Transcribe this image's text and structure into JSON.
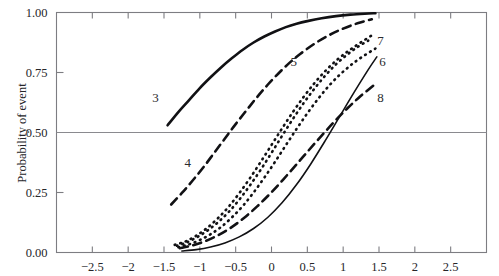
{
  "figure": {
    "background_color": "#ffffff",
    "ink_color": "#111114",
    "axis_color": "#7d7d82"
  },
  "chart_data": {
    "type": "line",
    "title": "",
    "xlabel": "",
    "ylabel": "Probability of event",
    "xlim": [
      -3.0,
      3.0
    ],
    "ylim": [
      0.0,
      1.0
    ],
    "grid": false,
    "reference_line_y": 0.5,
    "legend_position": "inline-curve-labels",
    "xticks": [
      -2.5,
      -2,
      -1.5,
      -1,
      -0.5,
      0,
      0.5,
      1,
      1.5,
      2,
      2.5
    ],
    "xtick_labels": [
      "−2.5",
      "−2",
      "−1.5",
      "−1",
      "−0.5",
      "0",
      "0.5",
      "1",
      "1.5",
      "2",
      "2.5"
    ],
    "yticks": [
      0.0,
      0.25,
      0.5,
      0.75,
      1.0
    ],
    "ytick_labels": [
      "0.00",
      "0.25",
      "0.50",
      "0.75",
      "1.00"
    ],
    "series": [
      {
        "name": "3",
        "label": "3",
        "style": "solid",
        "linewidth": 2.6,
        "label_x": -1.62,
        "label_y": 0.645,
        "x": [
          -1.45,
          -1.3,
          -1.15,
          -1.0,
          -0.85,
          -0.7,
          -0.55,
          -0.4,
          -0.25,
          -0.1,
          0.05,
          0.2,
          0.35,
          0.5,
          0.7,
          0.9,
          1.1,
          1.3,
          1.45
        ],
        "y": [
          0.53,
          0.585,
          0.635,
          0.685,
          0.73,
          0.772,
          0.81,
          0.845,
          0.875,
          0.9,
          0.921,
          0.939,
          0.953,
          0.964,
          0.976,
          0.985,
          0.991,
          0.995,
          0.997
        ]
      },
      {
        "name": "4",
        "label": "4",
        "style": "dashed",
        "linewidth": 2.6,
        "label_x": -1.17,
        "label_y": 0.375,
        "x": [
          -1.4,
          -1.25,
          -1.1,
          -0.95,
          -0.8,
          -0.65,
          -0.5,
          -0.35,
          -0.2,
          -0.05,
          0.1,
          0.25,
          0.4,
          0.6,
          0.8,
          1.0,
          1.2,
          1.4
        ],
        "y": [
          0.2,
          0.248,
          0.3,
          0.355,
          0.415,
          0.475,
          0.535,
          0.592,
          0.648,
          0.7,
          0.747,
          0.79,
          0.827,
          0.87,
          0.905,
          0.933,
          0.955,
          0.972
        ]
      },
      {
        "name": "5",
        "label": "5",
        "style": "dotted",
        "linewidth": 2.6,
        "label_x": 0.31,
        "label_y": 0.795,
        "x": [
          -1.32,
          -1.2,
          -1.05,
          -0.9,
          -0.75,
          -0.6,
          -0.45,
          -0.3,
          -0.15,
          0.0,
          0.15,
          0.3,
          0.45,
          0.6,
          0.75,
          0.9,
          1.05,
          1.2,
          1.35
        ],
        "y": [
          0.028,
          0.04,
          0.062,
          0.09,
          0.125,
          0.168,
          0.22,
          0.28,
          0.345,
          0.415,
          0.487,
          0.557,
          0.623,
          0.683,
          0.737,
          0.784,
          0.823,
          0.856,
          0.883
        ]
      },
      {
        "name": "6",
        "label": "6",
        "style": "dotted",
        "linewidth": 2.6,
        "label_x": 1.55,
        "label_y": 0.795,
        "x": [
          -1.3,
          -1.15,
          -1.0,
          -0.85,
          -0.7,
          -0.55,
          -0.4,
          -0.25,
          -0.1,
          0.05,
          0.2,
          0.35,
          0.5,
          0.65,
          0.8,
          0.95,
          1.1,
          1.25,
          1.45
        ],
        "y": [
          0.022,
          0.034,
          0.052,
          0.076,
          0.107,
          0.147,
          0.194,
          0.25,
          0.312,
          0.378,
          0.447,
          0.515,
          0.58,
          0.64,
          0.694,
          0.74,
          0.779,
          0.812,
          0.85
        ]
      },
      {
        "name": "7",
        "label": "7",
        "style": "dotted",
        "linewidth": 2.6,
        "label_x": 1.52,
        "label_y": 0.885,
        "x": [
          -1.35,
          -1.2,
          -1.05,
          -0.9,
          -0.75,
          -0.6,
          -0.45,
          -0.3,
          -0.15,
          0.0,
          0.15,
          0.3,
          0.45,
          0.6,
          0.75,
          0.9,
          1.05,
          1.2,
          1.4
        ],
        "y": [
          0.032,
          0.046,
          0.07,
          0.102,
          0.142,
          0.19,
          0.247,
          0.31,
          0.378,
          0.448,
          0.518,
          0.586,
          0.649,
          0.706,
          0.756,
          0.799,
          0.835,
          0.866,
          0.905
        ]
      },
      {
        "name": "8",
        "label": "8",
        "style": "dashed",
        "linewidth": 2.6,
        "label_x": 1.52,
        "label_y": 0.645,
        "x": [
          -1.28,
          -1.1,
          -0.92,
          -0.74,
          -0.56,
          -0.38,
          -0.2,
          -0.02,
          0.16,
          0.34,
          0.52,
          0.7,
          0.88,
          1.06,
          1.24,
          1.45
        ],
        "y": [
          0.018,
          0.03,
          0.048,
          0.073,
          0.105,
          0.145,
          0.192,
          0.245,
          0.303,
          0.364,
          0.426,
          0.487,
          0.546,
          0.601,
          0.651,
          0.702
        ]
      },
      {
        "name": "9",
        "label": "",
        "style": "solid",
        "linewidth": 1.6,
        "label_x": null,
        "label_y": null,
        "x": [
          -1.25,
          -1.05,
          -0.85,
          -0.65,
          -0.45,
          -0.25,
          -0.05,
          0.15,
          0.35,
          0.55,
          0.75,
          0.95,
          1.15,
          1.35,
          1.47
        ],
        "y": [
          0.006,
          0.012,
          0.023,
          0.04,
          0.065,
          0.1,
          0.147,
          0.208,
          0.283,
          0.37,
          0.466,
          0.566,
          0.666,
          0.762,
          0.815
        ]
      }
    ]
  }
}
